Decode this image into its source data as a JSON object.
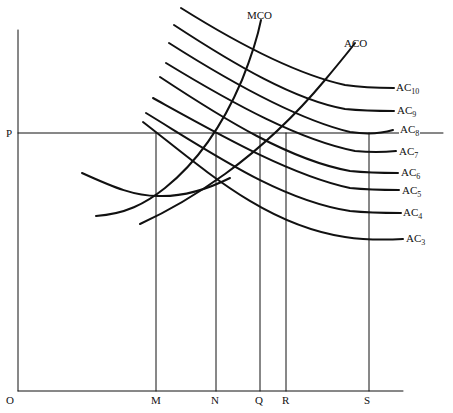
{
  "diagram": {
    "axes": {
      "origin_label": "O",
      "y_price_label": "P",
      "x_labels": [
        "M",
        "N",
        "Q",
        "R",
        "S"
      ]
    },
    "curves": {
      "mco_label": "MCO",
      "aco_label": "ACO",
      "ac_labels": [
        {
          "base": "AC",
          "sub": "10"
        },
        {
          "base": "AC",
          "sub": "9"
        },
        {
          "base": "AC",
          "sub": "8"
        },
        {
          "base": "AC",
          "sub": "7"
        },
        {
          "base": "AC",
          "sub": "6"
        },
        {
          "base": "AC",
          "sub": "5"
        },
        {
          "base": "AC",
          "sub": "4"
        },
        {
          "base": "AC",
          "sub": "3"
        }
      ]
    },
    "colors": {
      "line": "#111111",
      "background": "#ffffff"
    }
  }
}
